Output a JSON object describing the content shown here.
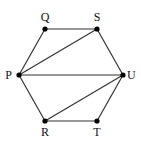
{
  "diagram": {
    "type": "graph",
    "vertices": [
      {
        "id": "Q",
        "label": "Q",
        "x": 45,
        "y": 29,
        "lx": 45,
        "ly": 21,
        "anchor": "middle"
      },
      {
        "id": "S",
        "label": "S",
        "x": 97,
        "y": 29,
        "lx": 97,
        "ly": 21,
        "anchor": "middle"
      },
      {
        "id": "P",
        "label": "P",
        "x": 19,
        "y": 75,
        "lx": 12,
        "ly": 79,
        "anchor": "end"
      },
      {
        "id": "U",
        "label": "U",
        "x": 123,
        "y": 75,
        "lx": 127,
        "ly": 79,
        "anchor": "start"
      },
      {
        "id": "R",
        "label": "R",
        "x": 45,
        "y": 121,
        "lx": 45,
        "ly": 136,
        "anchor": "middle"
      },
      {
        "id": "T",
        "label": "T",
        "x": 97,
        "y": 121,
        "lx": 97,
        "ly": 136,
        "anchor": "middle"
      }
    ],
    "edges": [
      [
        "P",
        "Q"
      ],
      [
        "Q",
        "S"
      ],
      [
        "S",
        "U"
      ],
      [
        "U",
        "T"
      ],
      [
        "T",
        "R"
      ],
      [
        "R",
        "P"
      ],
      [
        "P",
        "S"
      ],
      [
        "P",
        "U"
      ],
      [
        "R",
        "U"
      ]
    ],
    "colors": {
      "edge": "#333333",
      "vertex": "#000000",
      "label": "#111111"
    }
  }
}
